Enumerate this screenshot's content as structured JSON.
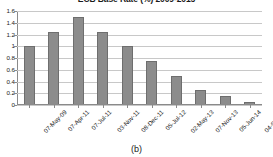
{
  "chart_data": {
    "type": "bar",
    "title": "ECB Base Rate (%) 2009-2015",
    "xlabel": "",
    "ylabel": "",
    "ylim": [
      0,
      1.6
    ],
    "yticks": [
      "0",
      "0.2",
      "0.4",
      "0.6",
      "0.8",
      "1",
      "1.2",
      "1.4",
      "1.6"
    ],
    "grid": true,
    "legend": "none",
    "categories": [
      "07-May-09",
      "07-Apr-11",
      "07-Jul-11",
      "03-Nov-11",
      "08-Dec-11",
      "05-Jul-12",
      "02-May-13",
      "07-Nov-13",
      "05-Jun-14",
      "04-Sep-14"
    ],
    "values": [
      1.0,
      1.25,
      1.5,
      1.25,
      1.0,
      0.75,
      0.5,
      0.25,
      0.15,
      0.05
    ],
    "series_color": "#8c8c8c"
  },
  "caption": "(b)",
  "colors": {
    "bar_fill": "#8c8c8c",
    "bar_border": "#6e6e6e",
    "gridline": "#c8c8c8",
    "axis": "#8a8a8a",
    "text": "#1a1a1a",
    "background": "#ffffff"
  }
}
